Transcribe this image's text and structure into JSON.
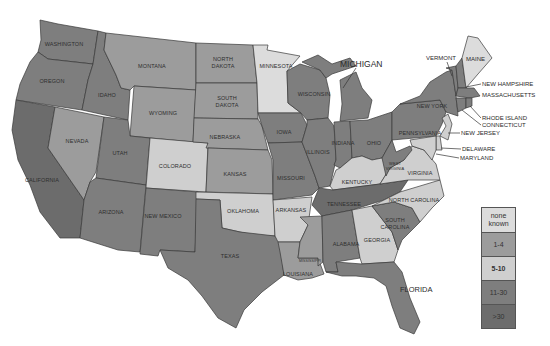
{
  "map": {
    "region": "United States (contiguous)",
    "colors": {
      "none_known": "#dcdcdc",
      "1-4": "#9c9c9c",
      "5-10": "#cfcfcf",
      "11-30": "#7e7e7e",
      "over_30": "#6c6c6c"
    },
    "states": [
      {
        "name": "WASHINGTON",
        "category": "11-30"
      },
      {
        "name": "OREGON",
        "category": "11-30"
      },
      {
        "name": "CALIFORNIA",
        "category": ">30"
      },
      {
        "name": "IDAHO",
        "category": "11-30"
      },
      {
        "name": "NEVADA",
        "category": "1-4"
      },
      {
        "name": "MONTANA",
        "category": "1-4"
      },
      {
        "name": "WYOMING",
        "category": "1-4"
      },
      {
        "name": "UTAH",
        "category": "11-30"
      },
      {
        "name": "ARIZONA",
        "category": "11-30"
      },
      {
        "name": "COLORADO",
        "category": "5-10"
      },
      {
        "name": "NEW MEXICO",
        "category": "11-30"
      },
      {
        "name": "NORTH DAKOTA",
        "category": "1-4"
      },
      {
        "name": "SOUTH DAKOTA",
        "category": "1-4"
      },
      {
        "name": "NEBRASKA",
        "category": "1-4"
      },
      {
        "name": "KANSAS",
        "category": "1-4"
      },
      {
        "name": "OKLAHOMA",
        "category": "5-10"
      },
      {
        "name": "TEXAS",
        "category": "11-30"
      },
      {
        "name": "MINNESOTA",
        "category": "none known"
      },
      {
        "name": "IOWA",
        "category": "11-30"
      },
      {
        "name": "MISSOURI",
        "category": "11-30"
      },
      {
        "name": "ARKANSAS",
        "category": "5-10"
      },
      {
        "name": "LOUISIANA",
        "category": "1-4"
      },
      {
        "name": "WISCONSIN",
        "category": "11-30"
      },
      {
        "name": "ILLINOIS",
        "category": "11-30"
      },
      {
        "name": "MICHIGAN",
        "category": "11-30"
      },
      {
        "name": "INDIANA",
        "category": "11-30"
      },
      {
        "name": "OHIO",
        "category": "11-30"
      },
      {
        "name": "KENTUCKY",
        "category": "5-10"
      },
      {
        "name": "TENNESSEE",
        "category": ">30"
      },
      {
        "name": "MISSISSIPPI",
        "category": "1-4"
      },
      {
        "name": "ALABAMA",
        "category": "11-30"
      },
      {
        "name": "GEORGIA",
        "category": "5-10"
      },
      {
        "name": "FLORIDA",
        "category": "11-30"
      },
      {
        "name": "SOUTH CAROLINA",
        "category": "11-30"
      },
      {
        "name": "NORTH CAROLINA",
        "category": "5-10"
      },
      {
        "name": "VIRGINIA",
        "category": "5-10"
      },
      {
        "name": "WEST VIRGINIA",
        "category": "11-30"
      },
      {
        "name": "PENNSYLVANIA",
        "category": "11-30"
      },
      {
        "name": "NEW YORK",
        "category": "11-30"
      },
      {
        "name": "VERMONT",
        "category": "11-30"
      },
      {
        "name": "NEW HAMPSHIRE",
        "category": "11-30"
      },
      {
        "name": "MAINE",
        "category": "none known"
      },
      {
        "name": "MASSACHUSETTS",
        "category": "11-30"
      },
      {
        "name": "RHODE ISLAND",
        "category": "11-30"
      },
      {
        "name": "CONNECTICUT",
        "category": "11-30"
      },
      {
        "name": "NEW JERSEY",
        "category": "5-10"
      },
      {
        "name": "DELAWARE",
        "category": "5-10"
      },
      {
        "name": "MARYLAND",
        "category": "5-10"
      }
    ],
    "labels": {
      "washington": "WASHINGTON",
      "oregon": "OREGON",
      "california": "CALIFORNIA",
      "idaho": "IDAHO",
      "nevada": "NEVADA",
      "montana": "MONTANA",
      "wyoming": "WYOMING",
      "utah": "UTAH",
      "arizona": "ARIZONA",
      "colorado": "COLORADO",
      "new_mexico": "NEW MEXICO",
      "north": "NORTH",
      "dakota_n": "DAKOTA",
      "south": "SOUTH",
      "dakota_s": "DAKOTA",
      "nebraska": "NEBRASKA",
      "kansas": "KANSAS",
      "oklahoma": "OKLAHOMA",
      "texas": "TEXAS",
      "minnesota": "MINNESOTA",
      "iowa": "IOWA",
      "missouri": "MISSOURI",
      "arkansas": "ARKANSAS",
      "louisiana": "LOUISIANA",
      "mississippi": "MISSISSIPPI",
      "wisconsin": "WISCONSIN",
      "illinois": "ILLINOIS",
      "michigan": "MICHIGAN",
      "indiana": "INDIANA",
      "ohio": "OHIO",
      "kentucky": "KENTUCKY",
      "tennessee": "TENNESSEE",
      "alabama": "ALABAMA",
      "georgia": "GEORGIA",
      "florida": "FLORIDA",
      "south_carolina_1": "SOUTH",
      "south_carolina_2": "CAROLINA",
      "north_carolina": "NORTH CAROLINA",
      "virginia": "VIRGINIA",
      "west_1": "WEST",
      "west_2": "VIRGINIA",
      "pennsylvania": "PENNSYLVANIA",
      "new_york": "NEW YORK",
      "vermont": "VERMONT",
      "maine": "MAINE",
      "new_hampshire": "NEW HAMPSHIRE",
      "massachusetts": "MASSACHUSETTS",
      "rhode_island": "RHODE ISLAND",
      "connecticut": "CONNECTICUT",
      "new_jersey": "NEW JERSEY",
      "delaware": "DELAWARE",
      "maryland": "MARYLAND"
    }
  },
  "legend": {
    "items": [
      {
        "label": "none known",
        "color": "#dcdcdc"
      },
      {
        "label": "1-4",
        "color": "#9c9c9c"
      },
      {
        "label": "5-10",
        "color": "#cfcfcf"
      },
      {
        "label": "11-30",
        "color": "#7e7e7e"
      },
      {
        "label": ">30",
        "color": "#6c6c6c"
      }
    ]
  }
}
